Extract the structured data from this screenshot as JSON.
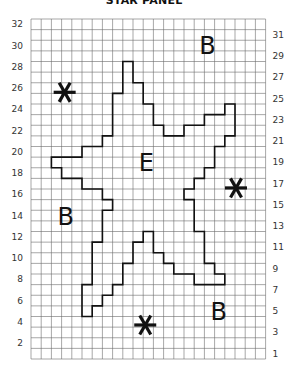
{
  "title": "STAR PANEL",
  "grid": {
    "columns": 23,
    "rows": 32,
    "left_row_labels": [
      "32",
      "30",
      "28",
      "26",
      "24",
      "22",
      "20",
      "18",
      "16",
      "14",
      "12",
      "10",
      "8",
      "6",
      "4",
      "2"
    ],
    "right_row_labels": [
      "31",
      "29",
      "27",
      "25",
      "23",
      "21",
      "19",
      "17",
      "15",
      "13",
      "11",
      "9",
      "7",
      "5",
      "3",
      "1"
    ],
    "line_color": "#6b6b6b",
    "outline_color": "#111111"
  },
  "star_outline_cells": [
    [
      9,
      4
    ],
    [
      10,
      4
    ],
    [
      10,
      6
    ],
    [
      11,
      6
    ],
    [
      11,
      8
    ],
    [
      12,
      8
    ],
    [
      12,
      10
    ],
    [
      13,
      10
    ],
    [
      13,
      11
    ],
    [
      15,
      11
    ],
    [
      15,
      10
    ],
    [
      17,
      10
    ],
    [
      17,
      9
    ],
    [
      19,
      9
    ],
    [
      19,
      8
    ],
    [
      20,
      8
    ],
    [
      20,
      11
    ],
    [
      19,
      11
    ],
    [
      19,
      12
    ],
    [
      18,
      12
    ],
    [
      18,
      14
    ],
    [
      17,
      14
    ],
    [
      17,
      15
    ],
    [
      16,
      15
    ],
    [
      16,
      16
    ],
    [
      15,
      16
    ],
    [
      15,
      17
    ],
    [
      16,
      17
    ],
    [
      16,
      20
    ],
    [
      17,
      20
    ],
    [
      17,
      23
    ],
    [
      18,
      23
    ],
    [
      18,
      24
    ],
    [
      19,
      24
    ],
    [
      19,
      25
    ],
    [
      16,
      25
    ],
    [
      16,
      24
    ],
    [
      14,
      24
    ],
    [
      14,
      23
    ],
    [
      13,
      23
    ],
    [
      13,
      22
    ],
    [
      12,
      22
    ],
    [
      12,
      20
    ],
    [
      11,
      20
    ],
    [
      11,
      21
    ],
    [
      10,
      21
    ],
    [
      10,
      23
    ],
    [
      9,
      23
    ],
    [
      9,
      25
    ],
    [
      8,
      25
    ],
    [
      8,
      26
    ],
    [
      7,
      26
    ],
    [
      7,
      27
    ],
    [
      6,
      27
    ],
    [
      6,
      28
    ],
    [
      5,
      28
    ],
    [
      5,
      25
    ],
    [
      6,
      25
    ],
    [
      6,
      21
    ],
    [
      7,
      21
    ],
    [
      7,
      18
    ],
    [
      8,
      18
    ],
    [
      8,
      17
    ],
    [
      7,
      17
    ],
    [
      7,
      16
    ],
    [
      5,
      16
    ],
    [
      5,
      15
    ],
    [
      3,
      15
    ],
    [
      3,
      14
    ],
    [
      2,
      14
    ],
    [
      2,
      13
    ],
    [
      5,
      13
    ],
    [
      5,
      12
    ],
    [
      7,
      12
    ],
    [
      7,
      11
    ],
    [
      8,
      11
    ],
    [
      8,
      7
    ],
    [
      9,
      7
    ]
  ],
  "labels": [
    {
      "text": "B",
      "col": 17.3,
      "row": 2.4,
      "kind": "letter"
    },
    {
      "text": "E",
      "col": 11.3,
      "row": 13.5,
      "kind": "letter"
    },
    {
      "text": "B",
      "col": 3.4,
      "row": 18.5,
      "kind": "letter"
    },
    {
      "text": "B",
      "col": 18.4,
      "row": 27.5,
      "kind": "letter"
    }
  ],
  "asterisks": [
    {
      "col": 3.3,
      "row": 6.9
    },
    {
      "col": 20.1,
      "row": 15.9
    },
    {
      "col": 11.2,
      "row": 28.8
    }
  ]
}
